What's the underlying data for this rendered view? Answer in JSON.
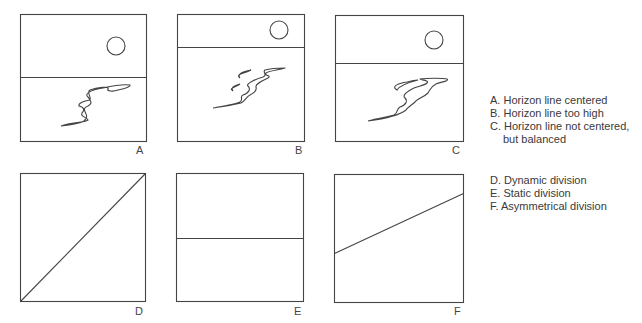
{
  "panels": [
    {
      "id": "A",
      "label": "A",
      "box": [
        20,
        14,
        126,
        127
      ],
      "horizon_y": 77,
      "sun": [
        116,
        46,
        9
      ],
      "stroke": "#444"
    },
    {
      "id": "B",
      "label": "B",
      "box": [
        177,
        14,
        127,
        127
      ],
      "horizon_y": 47,
      "sun": [
        279,
        30,
        9
      ],
      "stroke": "#444"
    },
    {
      "id": "C",
      "label": "C",
      "box": [
        335,
        15,
        128,
        126
      ],
      "horizon_y": 63,
      "sun": [
        434,
        40,
        9
      ],
      "stroke": "#444"
    },
    {
      "id": "D",
      "label": "D",
      "box": [
        20,
        173,
        125,
        128
      ],
      "line": [
        20,
        301,
        145,
        173
      ]
    },
    {
      "id": "E",
      "label": "E",
      "box": [
        176,
        173,
        127,
        128
      ],
      "line": [
        176,
        238,
        303,
        238
      ]
    },
    {
      "id": "F",
      "label": "F",
      "box": [
        334,
        174,
        129,
        128
      ],
      "line": [
        334,
        253,
        463,
        193
      ]
    }
  ],
  "legend_top": {
    "items": [
      {
        "letter": "A.",
        "text": "Horizon line centered"
      },
      {
        "letter": "B.",
        "text": "Horizon line too high"
      },
      {
        "letter": "C.",
        "text": "Horizon line not centered,"
      },
      {
        "letter": "",
        "text": "but balanced"
      }
    ]
  },
  "legend_bottom": {
    "items": [
      {
        "letter": "D.",
        "text": "Dynamic division"
      },
      {
        "letter": "E.",
        "text": "Static division"
      },
      {
        "letter": "F.",
        "text": "Asymmetrical division"
      }
    ]
  }
}
